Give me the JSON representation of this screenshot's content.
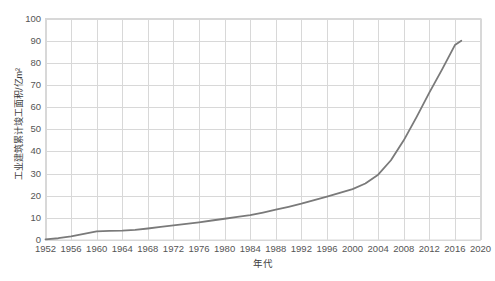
{
  "chart_data": {
    "type": "line",
    "title": "",
    "xlabel": "年代",
    "ylabel": "工业建筑累计竣工面积/亿m²",
    "xlim": [
      1952,
      2020
    ],
    "ylim": [
      0,
      100
    ],
    "grid": true,
    "legend": "none",
    "line_color": "#7a7a7a",
    "grid_color": "#d8d8d8",
    "axis_text_color": "#555555",
    "background": "#ffffff",
    "xticks": [
      1952,
      1956,
      1960,
      1964,
      1968,
      1972,
      1976,
      1980,
      1984,
      1988,
      1992,
      1996,
      2000,
      2004,
      2008,
      2012,
      2016,
      2020
    ],
    "yticks": [
      0,
      10,
      20,
      30,
      40,
      50,
      60,
      70,
      80,
      90,
      100
    ],
    "series": [
      {
        "name": "工业建筑累计竣工面积",
        "x": [
          1952,
          1954,
          1956,
          1958,
          1960,
          1962,
          1964,
          1966,
          1968,
          1970,
          1972,
          1974,
          1976,
          1978,
          1980,
          1982,
          1984,
          1986,
          1988,
          1990,
          1992,
          1994,
          1996,
          1998,
          2000,
          2002,
          2004,
          2006,
          2008,
          2010,
          2012,
          2014,
          2016,
          2017
        ],
        "values": [
          0.3,
          0.8,
          1.6,
          2.8,
          3.9,
          4.1,
          4.2,
          4.6,
          5.2,
          5.9,
          6.6,
          7.3,
          8.0,
          8.8,
          9.6,
          10.4,
          11.2,
          12.4,
          13.7,
          15.0,
          16.4,
          18.0,
          19.6,
          21.3,
          23.0,
          25.5,
          29.5,
          36.0,
          45.0,
          55.5,
          66.5,
          77.0,
          88.0,
          90.0
        ]
      }
    ]
  }
}
